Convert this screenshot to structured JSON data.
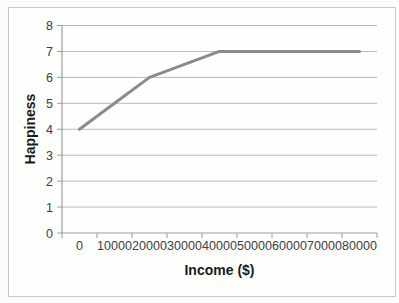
{
  "chart_data": {
    "type": "line",
    "title": "",
    "xlabel": "Income ($)",
    "ylabel": "Happiness",
    "categories": [
      "0",
      "10000",
      "20000",
      "30000",
      "40000",
      "50000",
      "60000",
      "70000",
      "80000"
    ],
    "values": [
      4,
      5,
      6,
      6.5,
      7,
      7,
      7,
      7,
      7
    ],
    "series_name": "Happiness vs Income",
    "ylim": [
      0,
      8
    ],
    "y_ticks": [
      "0",
      "1",
      "2",
      "3",
      "4",
      "5",
      "6",
      "7",
      "8"
    ],
    "grid": "horizontal",
    "legend": "none",
    "colors": {
      "line": "#8b8b8b",
      "gridline": "#b9b9b9",
      "axis": "#9c9c9c",
      "tick_text": "#3d3d3d",
      "title_text": "#1a1a1a",
      "frame_border": "#c8c8c8",
      "background": "#fefefd"
    }
  }
}
